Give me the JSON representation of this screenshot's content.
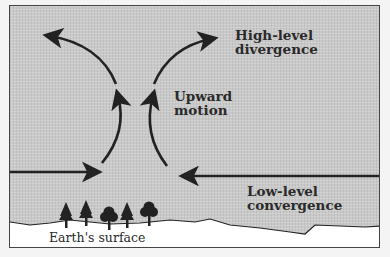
{
  "diagram": {
    "labels": {
      "high_level_line1": "High-level",
      "high_level_line2": "divergence",
      "upward_line1": "Upward",
      "upward_line2": "motion",
      "low_level_line1": "Low-level",
      "low_level_line2": "convergence",
      "surface": "Earth's surface"
    },
    "colors": {
      "sky_fill": "#c9c9c9",
      "ground_fill": "#ffffff",
      "arrow": "#222222",
      "text": "#2a2a2a"
    },
    "elements": {
      "trees": [
        "conifer",
        "conifer",
        "deciduous",
        "conifer",
        "deciduous"
      ],
      "arrows": [
        "low-level-inflow-left",
        "low-level-inflow-right",
        "upward-left",
        "upward-right",
        "high-level-outflow-left",
        "high-level-outflow-right"
      ]
    }
  }
}
